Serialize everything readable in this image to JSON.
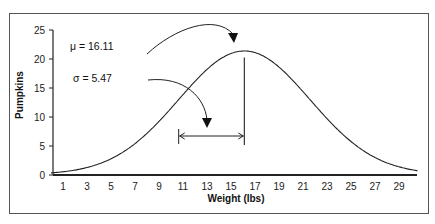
{
  "chart_data": {
    "type": "line",
    "title": "",
    "xlabel": "Weight (lbs)",
    "ylabel": "Pumpkins",
    "xlim": [
      0,
      31
    ],
    "ylim": [
      0,
      25
    ],
    "x_ticks": [
      1,
      3,
      5,
      7,
      9,
      11,
      13,
      15,
      17,
      19,
      21,
      23,
      25,
      27,
      29
    ],
    "y_ticks": [
      0,
      5,
      10,
      15,
      20,
      25
    ],
    "grid": false,
    "legend": "none",
    "series": [
      {
        "name": "Normal distribution of pumpkin weights",
        "distribution": "normal",
        "mean": 16.11,
        "std": 5.47,
        "peak": 21.3,
        "x": [
          0,
          2,
          4,
          6,
          8,
          10,
          12,
          14,
          16.11,
          18,
          20,
          22,
          24,
          26,
          28,
          30,
          31
        ],
        "values": [
          0.3,
          0.9,
          1.9,
          3.6,
          6.3,
          9.9,
          14.1,
          18.1,
          21.3,
          20.1,
          16.3,
          11.4,
          7.0,
          3.7,
          1.7,
          0.6,
          0.3
        ]
      }
    ],
    "annotations": [
      {
        "text": "μ = 16.11",
        "points_to": "mean",
        "x": 16.11,
        "y": 21.3
      },
      {
        "text": "σ = 5.47",
        "points_to": "standard-deviation-span",
        "x_from": 10.64,
        "x_to": 16.11,
        "y": 6
      }
    ]
  }
}
